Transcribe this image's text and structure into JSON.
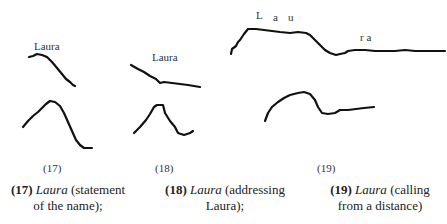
{
  "figure": {
    "panels": [
      {
        "id": "17",
        "label_text": "Laura",
        "number": "(17)",
        "caption": {
          "number": "(17)",
          "word": "Laura",
          "desc_line1": "(statement",
          "desc_line2": "of the name);"
        }
      },
      {
        "id": "18",
        "label_text": "Laura",
        "number": "(18)",
        "caption": {
          "number": "(18)",
          "word": "Laura",
          "desc_line1": "(addressing",
          "desc_line2": "Laura);"
        }
      },
      {
        "id": "19",
        "label_syllables": [
          "L",
          "a",
          "u"
        ],
        "label_tail": "r a",
        "number": "(19)",
        "caption": {
          "number": "(19)",
          "word": "Laura",
          "desc_line1": "(calling",
          "desc_line2": "from a distance)"
        }
      }
    ]
  }
}
